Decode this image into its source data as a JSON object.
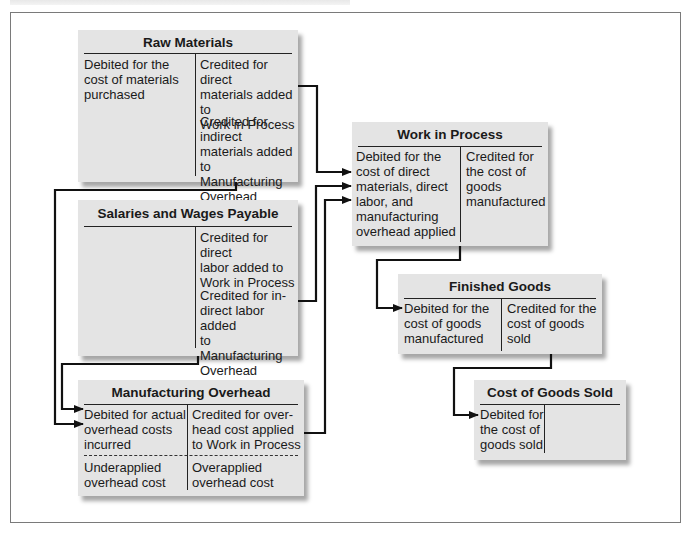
{
  "diagram": {
    "accounts": {
      "raw_materials": {
        "title": "Raw Materials",
        "debit": "Debited for the\ncost of materials\npurchased",
        "credit_1": "Credited for direct\nmaterials added to\nWork in Process",
        "credit_2": "Credited for indirect\nmaterials added to\nManufacturing\nOverhead"
      },
      "salaries_wages": {
        "title": "Salaries and Wages Payable",
        "debit": "",
        "credit_1": "Credited for direct\nlabor added to\nWork in Process",
        "credit_2": "Credited for in-\ndirect labor added\nto Manufacturing\nOverhead"
      },
      "manufacturing_overhead": {
        "title": "Manufacturing Overhead",
        "debit": "Debited for actual\noverhead costs\nincurred",
        "credit": "Credited for over-\nhead cost applied\nto Work in Process",
        "debit_balance": "Underapplied\noverhead cost",
        "credit_balance": "Overapplied\noverhead cost"
      },
      "work_in_process": {
        "title": "Work in Process",
        "debit": "Debited for the\ncost of direct\nmaterials, direct\nlabor, and\nmanufacturing\noverhead applied",
        "credit": "Credited for\nthe cost of\ngoods\nmanufactured"
      },
      "finished_goods": {
        "title": "Finished Goods",
        "debit": "Debited for the\ncost of goods\nmanufactured",
        "credit": "Credited for the\ncost of goods\nsold"
      },
      "cost_of_goods_sold": {
        "title": "Cost of Goods Sold",
        "debit": "Debited for\nthe cost of\ngoods sold",
        "credit": ""
      }
    },
    "flows": [
      {
        "from": "Raw Materials",
        "to": "Work in Process",
        "label": "direct materials"
      },
      {
        "from": "Raw Materials",
        "to": "Manufacturing Overhead",
        "label": "indirect materials"
      },
      {
        "from": "Salaries and Wages Payable",
        "to": "Work in Process",
        "label": "direct labor"
      },
      {
        "from": "Salaries and Wages Payable",
        "to": "Manufacturing Overhead",
        "label": "indirect labor"
      },
      {
        "from": "Manufacturing Overhead",
        "to": "Work in Process",
        "label": "overhead applied"
      },
      {
        "from": "Work in Process",
        "to": "Finished Goods",
        "label": "cost of goods manufactured"
      },
      {
        "from": "Finished Goods",
        "to": "Cost of Goods Sold",
        "label": "cost of goods sold"
      }
    ],
    "colors": {
      "box_fill": "#e4e4e4",
      "line": "#111111",
      "frame": "#7a7a7a"
    }
  }
}
